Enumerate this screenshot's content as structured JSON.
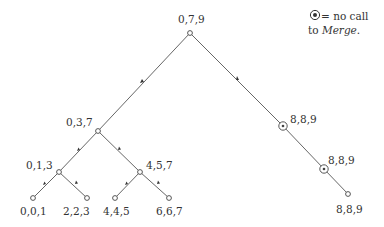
{
  "legend": {
    "symbol": "⊛",
    "line1": "= no call",
    "line2_prefix": "to ",
    "line2_italic": "Merge",
    "line2_suffix": "."
  },
  "nodes": [
    {
      "id": "root",
      "label": "0,7,9",
      "x": 190,
      "y": 33,
      "type": "plain"
    },
    {
      "id": "n037",
      "label": "0,3,7",
      "x": 98,
      "y": 131,
      "type": "plain"
    },
    {
      "id": "n013",
      "label": "0,1,3",
      "x": 59,
      "y": 172,
      "type": "plain"
    },
    {
      "id": "n457",
      "label": "4,5,7",
      "x": 140,
      "y": 172,
      "type": "plain"
    },
    {
      "id": "n001",
      "label": "0,0,1",
      "x": 33,
      "y": 198,
      "type": "plain"
    },
    {
      "id": "n223",
      "label": "2,2,3",
      "x": 87,
      "y": 198,
      "type": "plain"
    },
    {
      "id": "n445",
      "label": "4,4,5",
      "x": 115,
      "y": 198,
      "type": "plain"
    },
    {
      "id": "n667",
      "label": "6,6,7",
      "x": 169,
      "y": 198,
      "type": "plain"
    },
    {
      "id": "n889a",
      "label": "8,8,9",
      "x": 283,
      "y": 126,
      "type": "no-merge"
    },
    {
      "id": "n889b",
      "label": "8,8,9",
      "x": 324,
      "y": 169,
      "type": "no-merge"
    },
    {
      "id": "n889c",
      "label": "8,8,9",
      "x": 348,
      "y": 194,
      "type": "plain"
    }
  ],
  "labels": {
    "root": "0,7,9",
    "n037": "0,3,7",
    "n013": "0,1,3",
    "n457": "4,5,7",
    "n001": "0,0,1",
    "n223": "2,2,3",
    "n445": "4,4,5",
    "n667": "6,6,7",
    "n889a": "8,8,9",
    "n889b": "8,8,9",
    "n889c": "8,8,9"
  },
  "colors": {
    "edge": "#555555",
    "node_fill": "#ffffff",
    "text": "#333333"
  }
}
